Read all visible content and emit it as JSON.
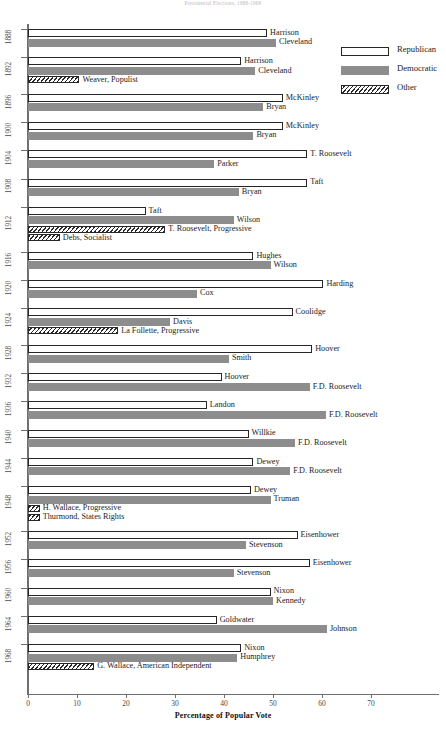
{
  "chart_title": "Presidential Elections, 1888-1968",
  "axis": {
    "xlabel": "Percentage of Popular Vote",
    "xlim": [
      0,
      78
    ],
    "ticks": [
      0,
      10,
      20,
      30,
      40,
      50,
      60,
      70
    ],
    "tick_labels": [
      "0",
      "10",
      "20",
      "30",
      "40",
      "50",
      "60",
      "70"
    ]
  },
  "legend": {
    "position": "top-right",
    "items": [
      {
        "label": "Republican",
        "swatch": "rep",
        "color": "#ffffff"
      },
      {
        "label": "Democratic",
        "swatch": "dem",
        "color": "#8d8d8d"
      },
      {
        "label": "Other",
        "swatch": "oth",
        "color": "hatched"
      }
    ]
  },
  "chart_data": {
    "type": "bar",
    "orientation": "horizontal",
    "title": "Presidential Elections, 1888-1968",
    "xlabel": "Percentage of Popular Vote",
    "ylabel": "",
    "xlim": [
      0,
      78
    ],
    "grid": false,
    "legend_position": "top-right",
    "categories": [
      "1888",
      "1892",
      "1896",
      "1900",
      "1904",
      "1908",
      "1912",
      "1916",
      "1920",
      "1924",
      "1928",
      "1932",
      "1936",
      "1940",
      "1944",
      "1948",
      "1952",
      "1956",
      "1960",
      "1964",
      "1968"
    ],
    "groups": [
      {
        "year": "1888",
        "bars": [
          {
            "name": "Harrison",
            "party": "rep",
            "value": 48.8
          },
          {
            "name": "Cleveland",
            "party": "dem",
            "value": 50.6
          }
        ]
      },
      {
        "year": "1892",
        "bars": [
          {
            "name": "Harrison",
            "party": "rep",
            "value": 43.5
          },
          {
            "name": "Cleveland",
            "party": "dem",
            "value": 46.4
          },
          {
            "name": "Weaver, Populist",
            "party": "oth",
            "value": 10.5
          }
        ]
      },
      {
        "year": "1896",
        "bars": [
          {
            "name": "McKinley",
            "party": "rep",
            "value": 52.0
          },
          {
            "name": "Bryan",
            "party": "dem",
            "value": 48.0
          }
        ]
      },
      {
        "year": "1900",
        "bars": [
          {
            "name": "McKinley",
            "party": "rep",
            "value": 52.0
          },
          {
            "name": "Bryan",
            "party": "dem",
            "value": 46.0
          }
        ]
      },
      {
        "year": "1904",
        "bars": [
          {
            "name": "T. Roosevelt",
            "party": "rep",
            "value": 57.0
          },
          {
            "name": "Parker",
            "party": "dem",
            "value": 38.0
          }
        ]
      },
      {
        "year": "1908",
        "bars": [
          {
            "name": "Taft",
            "party": "rep",
            "value": 57.0
          },
          {
            "name": "Bryan",
            "party": "dem",
            "value": 43.0
          }
        ]
      },
      {
        "year": "1912",
        "bars": [
          {
            "name": "Taft",
            "party": "rep",
            "value": 24.0
          },
          {
            "name": "Wilson",
            "party": "dem",
            "value": 42.0
          },
          {
            "name": "T. Roosevelt, Progressive",
            "party": "oth",
            "value": 28.0
          },
          {
            "name": "Debs, Socialist",
            "party": "oth",
            "value": 6.5
          }
        ]
      },
      {
        "year": "1916",
        "bars": [
          {
            "name": "Hughes",
            "party": "rep",
            "value": 46.0
          },
          {
            "name": "Wilson",
            "party": "dem",
            "value": 49.5
          }
        ]
      },
      {
        "year": "1920",
        "bars": [
          {
            "name": "Harding",
            "party": "rep",
            "value": 60.3
          },
          {
            "name": "Cox",
            "party": "dem",
            "value": 34.5
          }
        ]
      },
      {
        "year": "1924",
        "bars": [
          {
            "name": "Coolidge",
            "party": "rep",
            "value": 54.0
          },
          {
            "name": "Davis",
            "party": "dem",
            "value": 29.0
          },
          {
            "name": "La Follette, Progressive",
            "party": "oth",
            "value": 18.4
          }
        ]
      },
      {
        "year": "1928",
        "bars": [
          {
            "name": "Hoover",
            "party": "rep",
            "value": 58.0
          },
          {
            "name": "Smith",
            "party": "dem",
            "value": 41.0
          }
        ]
      },
      {
        "year": "1932",
        "bars": [
          {
            "name": "Hoover",
            "party": "rep",
            "value": 39.5
          },
          {
            "name": "F.D. Roosevelt",
            "party": "dem",
            "value": 57.5
          }
        ]
      },
      {
        "year": "1936",
        "bars": [
          {
            "name": "Landon",
            "party": "rep",
            "value": 36.5
          },
          {
            "name": "F.D. Roosevelt",
            "party": "dem",
            "value": 60.8
          }
        ]
      },
      {
        "year": "1940",
        "bars": [
          {
            "name": "Willkie",
            "party": "rep",
            "value": 45.0
          },
          {
            "name": "F.D. Roosevelt",
            "party": "dem",
            "value": 54.5
          }
        ]
      },
      {
        "year": "1944",
        "bars": [
          {
            "name": "Dewey",
            "party": "rep",
            "value": 46.0
          },
          {
            "name": "F.D. Roosevelt",
            "party": "dem",
            "value": 53.5
          }
        ]
      },
      {
        "year": "1948",
        "bars": [
          {
            "name": "Dewey",
            "party": "rep",
            "value": 45.5
          },
          {
            "name": "Truman",
            "party": "dem",
            "value": 49.5
          },
          {
            "name": "H. Wallace, Progressive",
            "party": "oth",
            "value": 2.4
          },
          {
            "name": "Thurmond, States Rights",
            "party": "oth",
            "value": 2.4
          }
        ]
      },
      {
        "year": "1952",
        "bars": [
          {
            "name": "Eisenhower",
            "party": "rep",
            "value": 55.0
          },
          {
            "name": "Stevenson",
            "party": "dem",
            "value": 44.5
          }
        ]
      },
      {
        "year": "1956",
        "bars": [
          {
            "name": "Eisenhower",
            "party": "rep",
            "value": 57.5
          },
          {
            "name": "Stevenson",
            "party": "dem",
            "value": 42.0
          }
        ]
      },
      {
        "year": "1960",
        "bars": [
          {
            "name": "Nixon",
            "party": "rep",
            "value": 49.5
          },
          {
            "name": "Kennedy",
            "party": "dem",
            "value": 50.0
          }
        ]
      },
      {
        "year": "1964",
        "bars": [
          {
            "name": "Goldwater",
            "party": "rep",
            "value": 38.5
          },
          {
            "name": "Johnson",
            "party": "dem",
            "value": 61.0
          }
        ]
      },
      {
        "year": "1968",
        "bars": [
          {
            "name": "Nixon",
            "party": "rep",
            "value": 43.5
          },
          {
            "name": "Humphrey",
            "party": "dem",
            "value": 42.7
          },
          {
            "name": "G. Wallace, American Independent",
            "party": "oth",
            "value": 13.5
          }
        ]
      }
    ]
  }
}
